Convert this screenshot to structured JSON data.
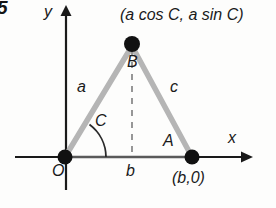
{
  "figure": {
    "problem_number": "5",
    "axes": {
      "x_label": "x",
      "y_label": "y"
    },
    "vertices": {
      "origin_label": "O",
      "apex_coord_label": "(a cos C, a sin C)",
      "right_coord_label": "(b,0)"
    },
    "sides": {
      "left_label": "a",
      "right_label": "c",
      "base_label": "b"
    },
    "angles": {
      "at_origin_label": "C",
      "at_right_label": "A",
      "at_apex_label": "B"
    },
    "colors": {
      "side_gray": "#b5b5b5",
      "axis_black": "#1a1a1a",
      "vertex_dot": "#111111",
      "dashed_gray": "#8c8c8c"
    }
  }
}
